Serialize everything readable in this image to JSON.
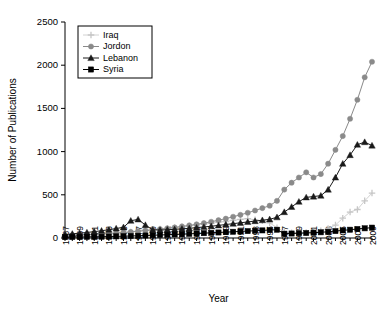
{
  "chart_data": {
    "type": "line",
    "title": "",
    "xlabel": "Year",
    "ylabel": "Number of Publications",
    "xlim": [
      1967,
      2009
    ],
    "ylim": [
      0,
      2500
    ],
    "yticks": [
      0,
      500,
      1000,
      1500,
      2000,
      2500
    ],
    "xticks": [
      1967,
      1969,
      1971,
      1973,
      1975,
      1977,
      1979,
      1981,
      1983,
      1985,
      1987,
      1989,
      1991,
      1993,
      1995,
      1997,
      1999,
      2001,
      2003,
      2005,
      2007,
      2009
    ],
    "grid": false,
    "legend_position": "top-left",
    "x": [
      1967,
      1968,
      1969,
      1970,
      1971,
      1972,
      1973,
      1974,
      1975,
      1976,
      1977,
      1978,
      1979,
      1980,
      1981,
      1982,
      1983,
      1984,
      1985,
      1986,
      1987,
      1988,
      1989,
      1990,
      1991,
      1992,
      1993,
      1994,
      1995,
      1996,
      1997,
      1998,
      1999,
      2000,
      2001,
      2002,
      2003,
      2004,
      2005,
      2006,
      2007,
      2008,
      2009
    ],
    "series": [
      {
        "name": "Iraq",
        "marker": "plus",
        "color": "#c6c6c6",
        "values": [
          20,
          22,
          25,
          24,
          28,
          30,
          34,
          38,
          60,
          70,
          82,
          90,
          96,
          104,
          112,
          120,
          130,
          140,
          150,
          162,
          170,
          185,
          190,
          205,
          215,
          225,
          210,
          200,
          175,
          120,
          70,
          62,
          60,
          65,
          70,
          85,
          110,
          150,
          230,
          300,
          330,
          430,
          520
        ]
      },
      {
        "name": "Jordon",
        "marker": "circle",
        "color": "#8a8a8a",
        "values": [
          28,
          32,
          36,
          40,
          44,
          48,
          52,
          58,
          64,
          70,
          78,
          86,
          94,
          102,
          112,
          122,
          134,
          146,
          158,
          172,
          188,
          206,
          224,
          246,
          268,
          292,
          318,
          346,
          374,
          430,
          560,
          640,
          700,
          760,
          700,
          740,
          860,
          1020,
          1180,
          1380,
          1600,
          1860,
          2040
        ]
      },
      {
        "name": "Lebanon",
        "marker": "triangle",
        "color": "#1a1a1a",
        "values": [
          40,
          48,
          56,
          64,
          74,
          84,
          96,
          110,
          124,
          200,
          215,
          150,
          95,
          92,
          96,
          100,
          106,
          112,
          120,
          128,
          136,
          146,
          156,
          166,
          176,
          186,
          196,
          206,
          216,
          240,
          300,
          360,
          420,
          470,
          480,
          490,
          560,
          700,
          860,
          960,
          1080,
          1110,
          1070
        ]
      },
      {
        "name": "Syria",
        "marker": "square",
        "color": "#000000",
        "values": [
          10,
          11,
          12,
          13,
          14,
          15,
          17,
          19,
          21,
          23,
          26,
          29,
          32,
          35,
          38,
          41,
          44,
          48,
          52,
          56,
          60,
          64,
          68,
          72,
          76,
          80,
          84,
          88,
          92,
          96,
          50,
          52,
          56,
          58,
          62,
          66,
          72,
          80,
          88,
          96,
          104,
          112,
          120
        ]
      }
    ]
  },
  "legend": {
    "entries": [
      {
        "label": "Iraq"
      },
      {
        "label": "Jordon"
      },
      {
        "label": "Lebanon"
      },
      {
        "label": "Syria"
      }
    ]
  }
}
